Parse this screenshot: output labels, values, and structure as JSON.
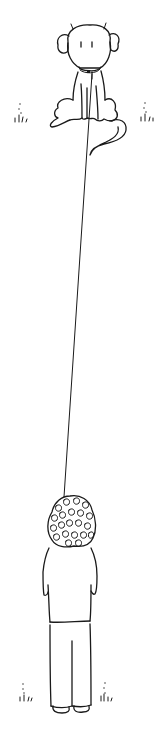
{
  "illustration": {
    "style": "black line drawing on white",
    "background_color": "#ffffff",
    "ink_color": "#1a1a1a",
    "subjects": [
      {
        "name": "dog",
        "description": "fluffy-eared dog sitting, wearing a collar with tag, tail curling to the right"
      },
      {
        "name": "leash",
        "description": "long thin leash from dog's collar down to the person"
      },
      {
        "name": "person",
        "description": "person with curly hair seen from behind, holding leash, wearing shirt and trousers"
      }
    ],
    "decorations": [
      {
        "name": "grass-tuft",
        "position": "left of dog"
      },
      {
        "name": "grass-tuft",
        "position": "right of dog"
      },
      {
        "name": "grass-tuft",
        "position": "left of person's feet"
      },
      {
        "name": "grass-tuft",
        "position": "right of person's feet"
      }
    ],
    "text": []
  }
}
